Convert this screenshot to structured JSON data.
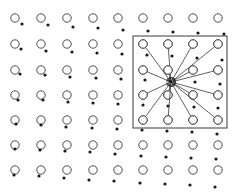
{
  "diagram": {
    "width": 237,
    "height": 192,
    "colors": {
      "background": "#ffffff",
      "stroke": "#3a3a3a",
      "dot": "#1a1a1a"
    },
    "circle_radius": 4.2,
    "dot_radius": 1.6,
    "grid_columns_x": [
      15,
      41,
      67,
      93,
      118,
      143,
      168,
      193,
      218
    ],
    "grid_rows_y": [
      18,
      44,
      70,
      95,
      120,
      145,
      170
    ],
    "dots": [
      [
        22,
        24
      ],
      [
        48,
        25
      ],
      [
        73,
        27
      ],
      [
        98,
        28
      ],
      [
        123,
        30
      ],
      [
        148,
        31
      ],
      [
        173,
        32
      ],
      [
        198,
        33
      ],
      [
        224,
        34
      ],
      [
        21,
        49
      ],
      [
        46,
        51
      ],
      [
        72,
        52
      ],
      [
        97,
        53
      ],
      [
        122,
        54
      ],
      [
        147,
        55
      ],
      [
        172,
        56
      ],
      [
        197,
        58
      ],
      [
        222,
        60
      ],
      [
        20,
        74
      ],
      [
        45,
        75
      ],
      [
        70,
        77
      ],
      [
        96,
        78
      ],
      [
        121,
        79
      ],
      [
        145,
        80
      ],
      [
        170,
        81
      ],
      [
        195,
        82
      ],
      [
        220,
        84
      ],
      [
        18,
        100
      ],
      [
        43,
        100
      ],
      [
        68,
        102
      ],
      [
        93,
        103
      ],
      [
        118,
        104
      ],
      [
        143,
        105
      ],
      [
        168,
        106
      ],
      [
        194,
        107
      ],
      [
        218,
        108
      ],
      [
        16,
        124
      ],
      [
        41,
        125
      ],
      [
        66,
        127
      ],
      [
        92,
        128
      ],
      [
        117,
        129
      ],
      [
        142,
        130
      ],
      [
        167,
        131
      ],
      [
        192,
        132
      ],
      [
        217,
        134
      ],
      [
        15,
        149
      ],
      [
        40,
        150
      ],
      [
        65,
        151
      ],
      [
        90,
        152
      ],
      [
        115,
        154
      ],
      [
        141,
        156
      ],
      [
        166,
        157
      ],
      [
        191,
        158
      ],
      [
        216,
        159
      ],
      [
        14,
        175
      ],
      [
        39,
        176
      ],
      [
        64,
        178
      ],
      [
        89,
        180
      ],
      [
        114,
        181
      ],
      [
        140,
        183
      ],
      [
        165,
        184
      ],
      [
        190,
        185
      ],
      [
        215,
        187
      ]
    ],
    "box": {
      "x": 133,
      "y": 36,
      "width": 94,
      "height": 92
    },
    "convergence_point": [
      171,
      82
    ],
    "box_circles": [
      [
        143,
        44
      ],
      [
        168,
        44
      ],
      [
        193,
        44
      ],
      [
        218,
        44
      ],
      [
        143,
        70
      ],
      [
        168,
        70
      ],
      [
        193,
        70
      ],
      [
        218,
        70
      ],
      [
        143,
        95
      ],
      [
        168,
        95
      ],
      [
        193,
        95
      ],
      [
        218,
        95
      ],
      [
        143,
        120
      ],
      [
        168,
        120
      ],
      [
        193,
        120
      ],
      [
        218,
        120
      ]
    ]
  }
}
